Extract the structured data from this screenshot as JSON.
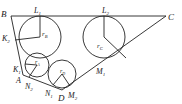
{
  "diagram": {
    "type": "geometry",
    "stroke_color": "#222222",
    "background": "#ffffff",
    "vertices": {
      "B": {
        "label": "B",
        "x": 11,
        "y": 16
      },
      "C": {
        "label": "C",
        "x": 166,
        "y": 16
      },
      "D": {
        "label": "D",
        "x": 62,
        "y": 90
      },
      "A": {
        "label": "A",
        "x": 23,
        "y": 75
      }
    },
    "circles": [
      {
        "name": "circle-B",
        "cx": 40,
        "cy": 37,
        "r": 21,
        "radius_label": "r",
        "radius_sub": "B",
        "radius_end": {
          "x": 19,
          "y": 37
        }
      },
      {
        "name": "circle-C",
        "cx": 104,
        "cy": 37,
        "r": 21,
        "radius_label": "r",
        "radius_sub": "C",
        "radius_end": {
          "x": 104,
          "y": 16
        }
      },
      {
        "name": "circle-A",
        "cx": 37,
        "cy": 65,
        "r": 12,
        "radius_label": "r",
        "radius_sub": "A",
        "radius_end": {
          "x": 26,
          "y": 68
        }
      },
      {
        "name": "circle-D",
        "cx": 62,
        "cy": 74,
        "r": 14,
        "radius_label": "r",
        "radius_sub": "D",
        "radius_end": {
          "x": 62,
          "y": 88
        }
      }
    ],
    "points": [
      {
        "label": "L",
        "sub": "1",
        "x": 38,
        "y": 11
      },
      {
        "label": "L",
        "sub": "2",
        "x": 107,
        "y": 11
      },
      {
        "label": "K",
        "sub": "2",
        "x": 2,
        "y": 40
      },
      {
        "label": "K",
        "sub": "1",
        "x": 13,
        "y": 71
      },
      {
        "label": "N",
        "sub": "2",
        "x": 24,
        "y": 89
      },
      {
        "label": "N",
        "sub": "1",
        "x": 45,
        "y": 96
      },
      {
        "label": "M",
        "sub": "2",
        "x": 69,
        "y": 96
      },
      {
        "label": "M",
        "sub": "1",
        "x": 96,
        "y": 73
      }
    ],
    "labels": {
      "B": "B",
      "C": "C",
      "D": "D",
      "A": "A",
      "L1": "L",
      "L1_sub": "1",
      "L2": "L",
      "L2_sub": "2",
      "K2": "K",
      "K2_sub": "2",
      "K1": "K",
      "K1_sub": "1",
      "N2": "N",
      "N2_sub": "2",
      "N1": "N",
      "N1_sub": "1",
      "M2": "M",
      "M2_sub": "2",
      "M1": "M",
      "M1_sub": "1",
      "rB": "r",
      "rB_sub": "B",
      "rC": "r",
      "rC_sub": "C",
      "rA": "r",
      "rA_sub": "A",
      "rD": "r",
      "rD_sub": "D"
    }
  }
}
